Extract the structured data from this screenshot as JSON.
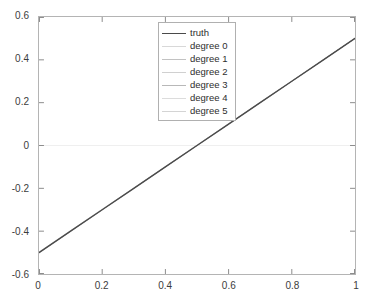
{
  "chart_data": {
    "type": "line",
    "title": "",
    "subtitle": "",
    "xlabel": "",
    "ylabel": "",
    "xlim": [
      0,
      1
    ],
    "ylim": [
      -0.6,
      0.6
    ],
    "grid": false,
    "legend_position": "upper-center-right",
    "x_ticks": [
      "0",
      "0.2",
      "0.4",
      "0.6",
      "0.8",
      "1"
    ],
    "x_tick_values": [
      0,
      0.2,
      0.4,
      0.6,
      0.8,
      1
    ],
    "y_ticks": [
      "0.6",
      "0.4",
      "0.2",
      "0",
      "-0.2",
      "-0.4",
      "-0.6"
    ],
    "y_tick_values": [
      0.6,
      0.4,
      0.2,
      0,
      -0.2,
      -0.4,
      -0.6
    ],
    "zero_line": 0,
    "x": [
      0,
      0.1,
      0.2,
      0.3,
      0.4,
      0.5,
      0.6,
      0.7,
      0.8,
      0.9,
      1
    ],
    "series": [
      {
        "name": "truth",
        "color": "#4a4a4a",
        "width": 1.4,
        "values": [
          -0.5,
          -0.4,
          -0.3,
          -0.2,
          -0.1,
          0,
          0.1,
          0.2,
          0.3,
          0.4,
          0.5
        ]
      },
      {
        "name": "degree 0",
        "color": "#d8d8d8",
        "width": 0.8,
        "values": [
          -0.497,
          -0.397,
          -0.297,
          -0.198,
          -0.098,
          0.002,
          0.102,
          0.202,
          0.301,
          0.401,
          0.5
        ]
      },
      {
        "name": "degree 1",
        "color": "#c2c2c2",
        "width": 0.8,
        "values": [
          -0.499,
          -0.399,
          -0.299,
          -0.199,
          -0.099,
          0.001,
          0.101,
          0.201,
          0.3,
          0.4,
          0.5
        ]
      },
      {
        "name": "degree 2",
        "color": "#d0d0d0",
        "width": 0.8,
        "values": [
          -0.5,
          -0.4,
          -0.3,
          -0.2,
          -0.1,
          0,
          0.1,
          0.2,
          0.3,
          0.4,
          0.5
        ]
      },
      {
        "name": "degree 3",
        "color": "#b8b8b8",
        "width": 0.8,
        "values": [
          -0.501,
          -0.401,
          -0.3,
          -0.2,
          -0.1,
          0,
          0.1,
          0.2,
          0.3,
          0.4,
          0.501
        ]
      },
      {
        "name": "degree 4",
        "color": "#dcdcdc",
        "width": 0.8,
        "values": [
          -0.5,
          -0.4,
          -0.3,
          -0.2,
          -0.1,
          0,
          0.1,
          0.2,
          0.3,
          0.4,
          0.5
        ]
      },
      {
        "name": "degree 5",
        "color": "#d4d4d4",
        "width": 0.8,
        "values": [
          -0.5,
          -0.4,
          -0.3,
          -0.2,
          -0.1,
          0,
          0.1,
          0.2,
          0.3,
          0.4,
          0.5
        ]
      }
    ]
  },
  "axes": {
    "border_color": "#b4b4b4",
    "tick_color": "#8c8c8c",
    "label_color": "#3c3c3c",
    "zero_line_color": "#efefef",
    "background": "#ffffff"
  },
  "legend": {
    "border_color": "#b0b0b0",
    "background": "#ffffff",
    "entries": [
      {
        "label": "truth"
      },
      {
        "label": "degree 0"
      },
      {
        "label": "degree 1"
      },
      {
        "label": "degree 2"
      },
      {
        "label": "degree 3"
      },
      {
        "label": "degree 4"
      },
      {
        "label": "degree 5"
      }
    ]
  }
}
